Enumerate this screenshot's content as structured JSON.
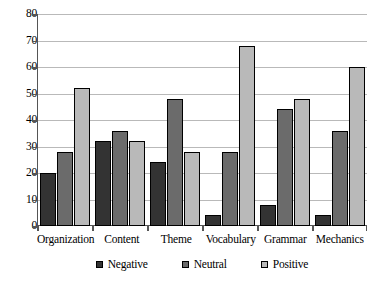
{
  "chart_data": {
    "type": "bar",
    "title": "",
    "subtitle": "",
    "xlabel": "",
    "ylabel": "",
    "ylim": [
      0,
      80
    ],
    "ytick_step": 10,
    "yticks": [
      80,
      70,
      60,
      50,
      40,
      30,
      20,
      10,
      0
    ],
    "grid": true,
    "grid_axis": "y",
    "legend_position": "bottom",
    "categories": [
      "Organization",
      "Content",
      "Theme",
      "Vocabulary",
      "Grammar",
      "Mechanics"
    ],
    "series": [
      {
        "name": "Negative",
        "color": "#333333",
        "values": [
          20,
          32,
          24,
          4,
          8,
          4
        ]
      },
      {
        "name": "Neutral",
        "color": "#6b6b6b",
        "values": [
          28,
          36,
          48,
          28,
          44,
          36
        ]
      },
      {
        "name": "Positive",
        "color": "#b9b9b9",
        "values": [
          52,
          32,
          28,
          68,
          48,
          60
        ]
      }
    ]
  },
  "legend": {
    "items": [
      {
        "label": "Negative",
        "swatch": "legend-swatch-negative"
      },
      {
        "label": "Neutral",
        "swatch": "legend-swatch-neutral"
      },
      {
        "label": "Positive",
        "swatch": "legend-swatch-positive"
      }
    ]
  }
}
